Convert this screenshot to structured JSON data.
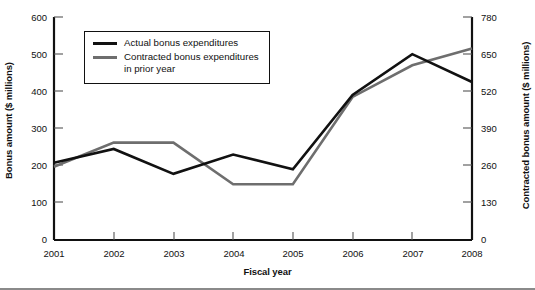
{
  "chart_data": {
    "type": "line",
    "title": "",
    "xlabel": "Fiscal year",
    "ylabel": "Bonus amount ($ millions)",
    "ylabel_right": "Contracted bonus amount ($ millions)",
    "categories": [
      "2001",
      "2002",
      "2003",
      "2004",
      "2005",
      "2006",
      "2007",
      "2008"
    ],
    "x": [
      2001,
      2002,
      2003,
      2004,
      2005,
      2006,
      2007,
      2008
    ],
    "ylim": [
      0,
      600
    ],
    "ylim_right": [
      0,
      780
    ],
    "yticks": [
      0,
      100,
      200,
      300,
      400,
      500,
      600
    ],
    "yticks_right": [
      0,
      130,
      260,
      390,
      520,
      650,
      780
    ],
    "grid": false,
    "legend_position": "upper-left-inside",
    "series": [
      {
        "name": "Actual bonus expenditures",
        "axis": "left",
        "color": "#111111",
        "values": [
          208,
          245,
          178,
          230,
          190,
          390,
          500,
          425
        ]
      },
      {
        "name": "Contracted bonus expenditures in prior year",
        "axis": "left",
        "color": "#6e6e6e",
        "values": [
          197,
          262,
          262,
          150,
          150,
          385,
          470,
          515
        ]
      }
    ]
  },
  "axes": {
    "left": {
      "title": "Bonus amount ($ millions)",
      "ticks": [
        "600",
        "500",
        "400",
        "300",
        "200",
        "100",
        "0"
      ]
    },
    "right": {
      "title": "Contracted bonus amount ($ millions)",
      "ticks": [
        "780",
        "650",
        "520",
        "390",
        "260",
        "130",
        "0"
      ]
    },
    "bottom": {
      "title": "Fiscal year",
      "ticks": [
        "2001",
        "2002",
        "2003",
        "2004",
        "2005",
        "2006",
        "2007",
        "2008"
      ]
    }
  },
  "legend": {
    "items": [
      {
        "label": "Actual bonus expenditures",
        "color": "#111111",
        "weight": "thick"
      },
      {
        "label": "Contracted bonus expenditures\nin prior year",
        "color": "#6e6e6e",
        "weight": "normal"
      }
    ]
  }
}
